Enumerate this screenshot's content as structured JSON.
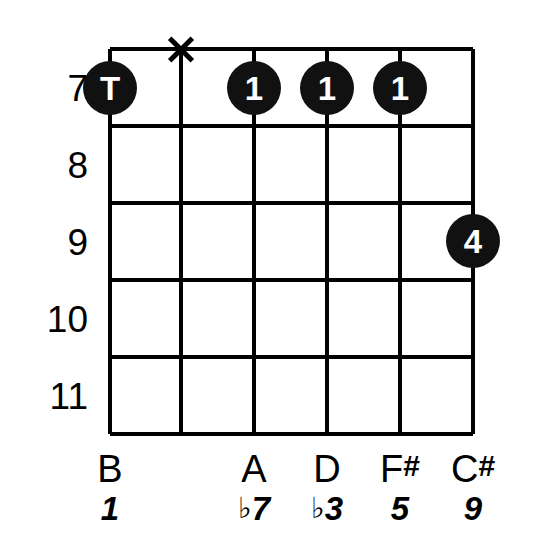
{
  "diagram": {
    "type": "guitar-chord-diagram",
    "ink_color": "#000000",
    "background_color": "#ffffff",
    "dot_color": "#111111",
    "dot_text_color": "#ffffff",
    "string_count": 6,
    "fret_row_count": 5
  },
  "fret_numbers": [
    {
      "label": "7"
    },
    {
      "label": "8"
    },
    {
      "label": "9"
    },
    {
      "label": "10"
    },
    {
      "label": "11"
    }
  ],
  "strings": [
    {
      "index": 1,
      "note": "B",
      "note_accidental": "",
      "interval": "1",
      "interval_accidental": ""
    },
    {
      "index": 2,
      "note": "",
      "note_accidental": "",
      "interval": "",
      "interval_accidental": ""
    },
    {
      "index": 3,
      "note": "A",
      "note_accidental": "",
      "interval": "7",
      "interval_accidental": "♭"
    },
    {
      "index": 4,
      "note": "D",
      "note_accidental": "",
      "interval": "3",
      "interval_accidental": "♭"
    },
    {
      "index": 5,
      "note": "F",
      "note_accidental": "#",
      "interval": "5",
      "interval_accidental": ""
    },
    {
      "index": 6,
      "note": "C",
      "note_accidental": "#",
      "interval": "9",
      "interval_accidental": ""
    }
  ],
  "finger_dots": [
    {
      "label": "T",
      "string": 1,
      "fret": "7"
    },
    {
      "label": "1",
      "string": 3,
      "fret": "7"
    },
    {
      "label": "1",
      "string": 4,
      "fret": "7"
    },
    {
      "label": "1",
      "string": 5,
      "fret": "7"
    },
    {
      "label": "4",
      "string": 6,
      "fret": "9"
    }
  ],
  "muted_strings": [
    {
      "string": 2,
      "marker": "X"
    }
  ]
}
